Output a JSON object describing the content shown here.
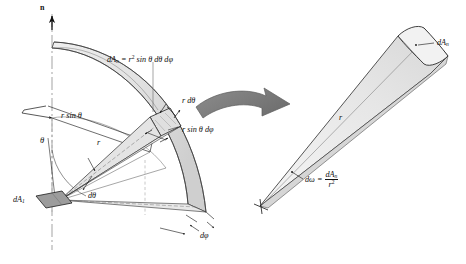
{
  "figure": {
    "width": 466,
    "height": 264,
    "background": "#ffffff"
  },
  "colors": {
    "ink": "#111111",
    "line": "#3a3a3a",
    "band_fill": "#e9e9e9",
    "band_fill_dark": "#d2d2d2",
    "patch_fill": "#9a9a9a",
    "cone_fill": "#efefef",
    "cone_fill_shade": "#dcdcdc",
    "arrow_fill": "#808080",
    "arrow_stroke": "#5a5a5a",
    "dash": "#8a8a8a"
  },
  "left_diagram": {
    "name": "hemisphere-solid-angle-diagram",
    "axis_label": "n",
    "labels": {
      "dAn_formula_lead": "dA",
      "dAn_formula_sub": "n",
      "dAn_formula_eq": " = r",
      "dAn_formula_sup": "2",
      "dAn_formula_tail": " sin θ dθ dφ",
      "dAn_formula_plain": "dAₙ = r² sin θ dθ dφ",
      "r_dtheta": "r dθ",
      "r_sin_theta_dphi": "r sin θ dφ",
      "r_sin_theta": "r sin θ",
      "theta": "θ",
      "r": "r",
      "dtheta": "dθ",
      "dphi": "dφ",
      "dA1_lead": "dA",
      "dA1_sub": "1",
      "dA1_plain": "dA₁"
    }
  },
  "transition_arrow": {
    "name": "transition-arrow",
    "direction": "right"
  },
  "right_diagram": {
    "name": "solid-angle-cone-diagram",
    "labels": {
      "dAn_lead": "dA",
      "dAn_sub": "n",
      "dAn_plain": "dAₙ",
      "r": "r",
      "domega_lead": "dω = ",
      "domega_num_lead": "dA",
      "domega_num_sub": "n",
      "domega_den_lead": "r",
      "domega_den_sup": "2",
      "domega_plain": "dω = dAₙ / r²"
    }
  }
}
